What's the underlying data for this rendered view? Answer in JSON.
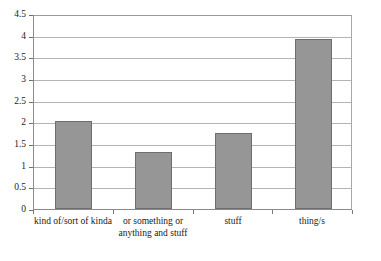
{
  "chart_data": {
    "type": "bar",
    "title": "",
    "subtitle": "",
    "xlabel": "",
    "ylabel": "",
    "categories": [
      "kind of/sort of kinda",
      "or something or anything and stuff",
      "stuff",
      "thing/s"
    ],
    "values": [
      2.03,
      1.32,
      1.75,
      3.93
    ],
    "ylim": [
      0,
      4.5
    ],
    "yticks": [
      0,
      0.5,
      1,
      1.5,
      2,
      2.5,
      3,
      3.5,
      4,
      4.5
    ],
    "ytick_labels": [
      "0",
      "0.5",
      "1",
      "1.5",
      "2",
      "2.5",
      "3",
      "3.5",
      "4",
      "4.5"
    ],
    "grid": true,
    "legend": false,
    "legend_position": "none",
    "bar_color": "#969696",
    "bar_border_color": "#6e6e6e",
    "gridline_color": "#b4b4b4",
    "axis_color": "#8a8a8a",
    "background_color": "#ffffff"
  },
  "axis": {
    "y_tick_labels": [
      "4.5",
      "4",
      "3.5",
      "3",
      "2.5",
      "2",
      "1.5",
      "1",
      "0.5",
      "0"
    ],
    "x_category_labels": [
      "kind of/sort of kinda",
      "or something or anything and stuff",
      "stuff",
      "thing/s"
    ]
  }
}
